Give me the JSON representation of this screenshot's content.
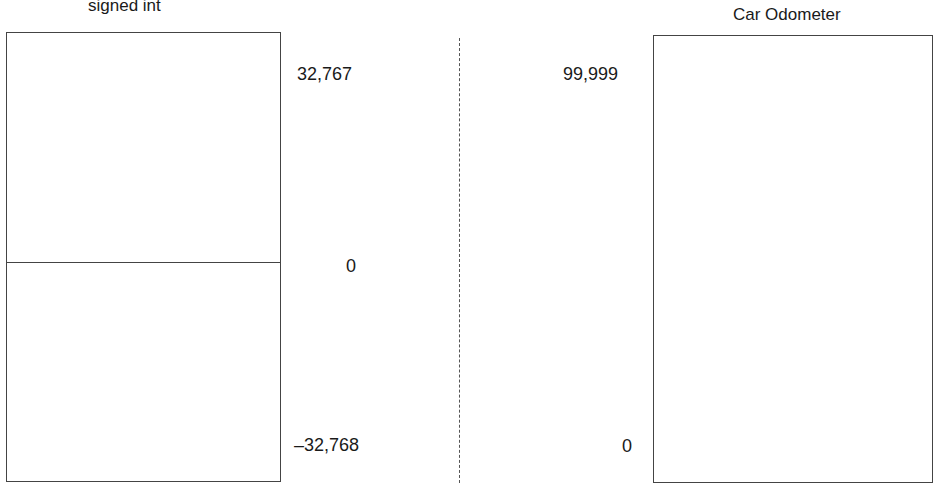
{
  "left_panel": {
    "title": "signed int",
    "labels": {
      "max": "32,767",
      "zero": "0",
      "min": "–32,768"
    }
  },
  "right_panel": {
    "title": "Car Odometer",
    "labels": {
      "max": "99,999",
      "min": "0"
    }
  },
  "colors": {
    "stroke": "#444444",
    "text": "#1a1a1a",
    "background": "#ffffff"
  }
}
